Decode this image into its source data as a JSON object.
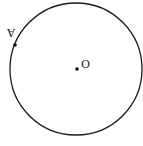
{
  "diagram": {
    "type": "circle",
    "circle": {
      "cx": 76,
      "cy": 69,
      "r": 66,
      "stroke": "#1a1a1a"
    },
    "points": [
      {
        "id": "O",
        "label": "O",
        "x": 77,
        "y": 69,
        "role": "center"
      },
      {
        "id": "A",
        "label": "A",
        "x": 15,
        "y": 45,
        "role": "on-circle",
        "label_rotated": true
      }
    ]
  }
}
